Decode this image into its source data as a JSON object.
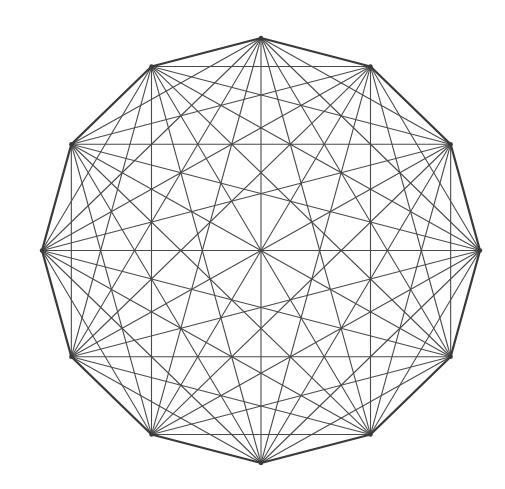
{
  "diagram": {
    "type": "complete-graph-polygon",
    "shape": "regular dodecagon with all diagonals",
    "vertex_count": 12,
    "center": [
      261,
      250.5
    ],
    "radius_x": 219,
    "radius_y": 212.5,
    "start_angle_deg": -90,
    "colors": {
      "background": "#ffffff",
      "edge": "#3a3a3a",
      "diagonal": "#4a4a4a"
    },
    "stroke_widths": {
      "edge": 2.2,
      "diagonal": 1.1
    }
  }
}
